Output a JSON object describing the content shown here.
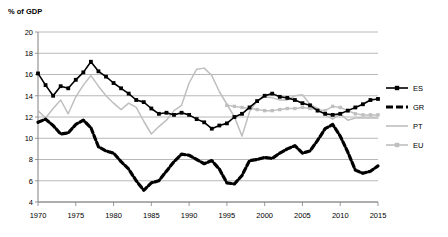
{
  "chart_data": {
    "type": "line",
    "title": "",
    "ylabel": "% of GDP",
    "xlabel": "",
    "ylim": [
      4,
      20
    ],
    "xlim": [
      1970,
      2015
    ],
    "ytick_step": 2,
    "xtick_step": 5,
    "yticks": [
      20,
      18,
      16,
      14,
      12,
      10,
      8,
      6,
      4
    ],
    "xticks": [
      1970,
      1975,
      1980,
      1985,
      1990,
      1995,
      2000,
      2005,
      2010,
      2015
    ],
    "grid": "horizontal",
    "legend_position": "right",
    "colors": {
      "ES": "#000000",
      "GR": "#000000",
      "PT": "#bfbfbf",
      "EU": "#bfbfbf",
      "grid": "#a6a6a6",
      "axis": "#808080",
      "background": "#ffffff"
    },
    "series": [
      {
        "name": "ES",
        "label": "ES",
        "color": "#000000",
        "style": "solid",
        "marker": "square",
        "x": [
          1970,
          1971,
          1972,
          1973,
          1974,
          1975,
          1976,
          1977,
          1978,
          1979,
          1980,
          1981,
          1982,
          1983,
          1984,
          1985,
          1986,
          1987,
          1988,
          1989,
          1990,
          1991,
          1992,
          1993,
          1994,
          1995,
          1996,
          1997,
          1998,
          1999,
          2000,
          2001,
          2002,
          2003,
          2004,
          2005,
          2006,
          2007,
          2008,
          2009,
          2010,
          2011,
          2012,
          2013,
          2014,
          2015
        ],
        "values": [
          16.1,
          15.0,
          14.0,
          14.9,
          14.7,
          15.5,
          16.2,
          17.2,
          16.3,
          15.8,
          15.2,
          14.7,
          14.2,
          13.6,
          13.4,
          12.8,
          12.3,
          12.4,
          12.2,
          12.4,
          12.2,
          11.8,
          11.5,
          10.9,
          11.2,
          11.4,
          12.0,
          12.3,
          12.9,
          13.5,
          14.0,
          14.2,
          13.9,
          13.8,
          13.6,
          13.3,
          13.1,
          12.6,
          12.3,
          12.2,
          12.3,
          12.6,
          12.9,
          13.2,
          13.6,
          13.7
        ]
      },
      {
        "name": "GR",
        "label": "GR",
        "color": "#000000",
        "style": "dashed",
        "marker": "none",
        "x": [
          1970,
          1971,
          1972,
          1973,
          1974,
          1975,
          1976,
          1977,
          1978,
          1979,
          1980,
          1981,
          1982,
          1983,
          1984,
          1985,
          1986,
          1987,
          1988,
          1989,
          1990,
          1991,
          1992,
          1993,
          1994,
          1995,
          1996,
          1997,
          1998,
          1999,
          2000,
          2001,
          2002,
          2003,
          2004,
          2005,
          2006,
          2007,
          2008,
          2009,
          2010,
          2011,
          2012,
          2013,
          2014,
          2015
        ],
        "values": [
          11.5,
          11.8,
          11.2,
          10.4,
          10.5,
          11.3,
          11.7,
          11.0,
          9.2,
          8.8,
          8.6,
          7.8,
          7.1,
          6.0,
          5.1,
          5.8,
          6.0,
          6.9,
          7.8,
          8.5,
          8.4,
          8.0,
          7.6,
          7.9,
          7.1,
          5.8,
          5.7,
          6.5,
          7.9,
          8.0,
          8.2,
          8.1,
          8.6,
          9.0,
          9.3,
          8.6,
          8.8,
          9.8,
          10.9,
          11.3,
          10.2,
          8.7,
          7.0,
          6.7,
          6.9,
          7.4
        ]
      },
      {
        "name": "PT",
        "label": "PT",
        "color": "#bfbfbf",
        "style": "solid",
        "marker": "none",
        "x": [
          1970,
          1971,
          1972,
          1973,
          1974,
          1975,
          1976,
          1977,
          1978,
          1979,
          1980,
          1981,
          1982,
          1983,
          1984,
          1985,
          1986,
          1987,
          1988,
          1989,
          1990,
          1991,
          1992,
          1993,
          1994,
          1995,
          1996,
          1997,
          1998,
          1999,
          2000,
          2001,
          2002,
          2003,
          2004,
          2005,
          2006,
          2007,
          2008,
          2009,
          2010,
          2011,
          2012,
          2013,
          2014,
          2015
        ],
        "values": [
          12.6,
          11.9,
          12.8,
          13.6,
          12.3,
          13.9,
          15.0,
          15.9,
          14.9,
          14.0,
          13.3,
          12.7,
          13.3,
          12.9,
          11.6,
          10.4,
          11.1,
          11.7,
          12.6,
          13.1,
          15.2,
          16.5,
          16.6,
          15.9,
          14.4,
          13.2,
          12.0,
          10.2,
          12.5,
          13.5,
          13.9,
          13.8,
          13.6,
          13.6,
          14.0,
          14.1,
          13.2,
          12.8,
          12.2,
          11.8,
          12.3,
          11.7,
          11.9,
          11.9,
          11.9,
          11.9
        ]
      },
      {
        "name": "EU",
        "label": "EU",
        "color": "#bfbfbf",
        "style": "solid",
        "marker": "square",
        "x": [
          1995,
          1996,
          1997,
          1998,
          1999,
          2000,
          2001,
          2002,
          2003,
          2004,
          2005,
          2006,
          2007,
          2008,
          2009,
          2010,
          2011,
          2012,
          2013,
          2014,
          2015
        ],
        "values": [
          13.1,
          13.0,
          12.9,
          12.8,
          12.7,
          12.6,
          12.6,
          12.7,
          12.8,
          12.8,
          12.9,
          12.8,
          12.7,
          12.6,
          13.0,
          12.9,
          12.6,
          12.3,
          12.2,
          12.2,
          12.2
        ]
      }
    ]
  },
  "legend": {
    "entries": [
      {
        "label": "ES"
      },
      {
        "label": "GR"
      },
      {
        "label": "PT"
      },
      {
        "label": "EU"
      }
    ]
  }
}
